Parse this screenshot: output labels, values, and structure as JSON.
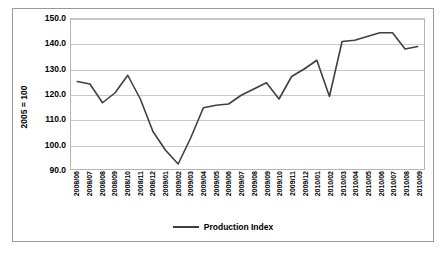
{
  "chart_data": {
    "type": "line",
    "title": "",
    "xlabel": "",
    "ylabel": "2005 = 100",
    "ylim": [
      90.0,
      150.0
    ],
    "ytick_labels": [
      "150.0",
      "140.0",
      "130.0",
      "120.0",
      "110.0",
      "100.0",
      "90.0"
    ],
    "ytick_values": [
      150.0,
      140.0,
      130.0,
      120.0,
      110.0,
      100.0,
      90.0
    ],
    "grid": true,
    "legend_position": "bottom-center",
    "categories": [
      "2008/06",
      "2008/07",
      "2008/08",
      "2008/09",
      "2008/10",
      "2008/11",
      "2008/12",
      "2009/01",
      "2009/02",
      "2009/03",
      "2009/04",
      "2009/05",
      "2009/06",
      "2009/07",
      "2009/08",
      "2009/09",
      "2009/10",
      "2009/11",
      "2009/12",
      "2010/01",
      "2010/02",
      "2010/03",
      "2010/04",
      "2010/05",
      "2010/06",
      "2010/07",
      "2010/08",
      "2010/09"
    ],
    "series": [
      {
        "name": "Production Index",
        "color": "#3f3f3f",
        "values": [
          125.0,
          124.0,
          116.5,
          120.5,
          127.5,
          118.0,
          105.0,
          97.5,
          92.0,
          102.5,
          114.5,
          115.5,
          116.0,
          119.5,
          122.0,
          124.5,
          118.0,
          127.0,
          130.0,
          133.5,
          119.0,
          141.0,
          141.5,
          143.0,
          144.5,
          144.5,
          138.0,
          139.0
        ]
      }
    ]
  },
  "legend": {
    "entries": [
      {
        "label": "Production Index",
        "color": "#3f3f3f"
      }
    ]
  }
}
